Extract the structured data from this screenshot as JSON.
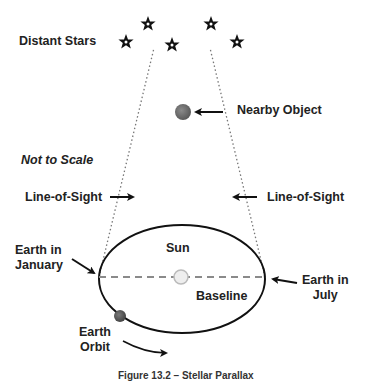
{
  "labels": {
    "distant_stars": "Distant Stars",
    "nearby_object": "Nearby Object",
    "not_to_scale": "Not to Scale",
    "line_of_sight_left": "Line-of-Sight",
    "line_of_sight_right": "Line-of-Sight",
    "earth_january_line1": "Earth in",
    "earth_january_line2": "January",
    "earth_july_line1": "Earth in",
    "earth_july_line2": "July",
    "sun": "Sun",
    "baseline": "Baseline",
    "earth_orbit_line1": "Earth",
    "earth_orbit_line2": "Orbit",
    "caption": "Figure 13.2 – Stellar Parallax"
  },
  "colors": {
    "line": "#111111",
    "dotted": "#777777",
    "baseline": "#8a8a8a",
    "nearby_object": "#6e6e6e",
    "sun_fill": "#eeeeee",
    "sun_stroke": "#bbbbbb",
    "earth": "#555555"
  },
  "stars": [
    {
      "x": 126,
      "y": 42
    },
    {
      "x": 148,
      "y": 24
    },
    {
      "x": 172,
      "y": 45
    },
    {
      "x": 211,
      "y": 24
    },
    {
      "x": 237,
      "y": 42
    }
  ]
}
